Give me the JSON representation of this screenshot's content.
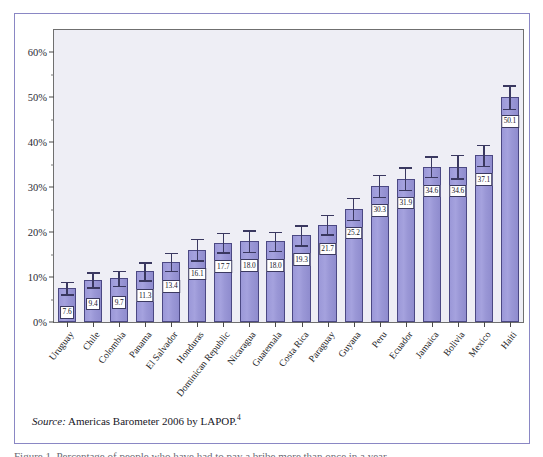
{
  "figure": {
    "source_prefix": "Source:",
    "source_text": " Americas Barometer 2006 by LAPOP.",
    "source_footnote": "4",
    "clipped_caption": "Figure 1. Percentage of people who have had to pay a bribe more than once in a year"
  },
  "chart_data": {
    "type": "bar",
    "title": "",
    "subtitle": "",
    "xlabel": "",
    "ylabel": "",
    "ylim": [
      0,
      65
    ],
    "grid": false,
    "legend": "none",
    "y_tick_labels": [
      "0%",
      "10%",
      "20%",
      "30%",
      "40%",
      "50%",
      "60%"
    ],
    "y_tick_values": [
      0,
      10,
      20,
      30,
      40,
      50,
      60
    ],
    "y_minor_tick_values": [
      5,
      15,
      25,
      35,
      45,
      55
    ],
    "bar_color": "#9b98d8",
    "bar_border_color": "#4b4883",
    "error_bar_color": "#3a3860",
    "plot_background": "#eeeef5",
    "frame_color": "#8a87c4",
    "categories": [
      "Uruguay",
      "Chile",
      "Colombia",
      "Panama",
      "El Salvador",
      "Honduras",
      "Dominican Republic",
      "Nicaragua",
      "Guatemala",
      "Costa Rica",
      "Paraguay",
      "Guyana",
      "Peru",
      "Ecuador",
      "Jamaica",
      "Bolivia",
      "Mexico",
      "Haiti"
    ],
    "values": [
      7.6,
      9.4,
      9.7,
      11.3,
      13.4,
      16.1,
      17.7,
      18.0,
      18.0,
      19.3,
      21.7,
      25.2,
      30.3,
      31.9,
      34.6,
      34.6,
      37.1,
      50.1
    ],
    "value_labels": [
      "7.6",
      "9.4",
      "9.7",
      "11.3",
      "13.4",
      "16.1",
      "17.7",
      "18.0",
      "18.0",
      "19.3",
      "21.7",
      "25.2",
      "30.3",
      "31.9",
      "34.6",
      "34.6",
      "37.1",
      "50.1"
    ],
    "error_upper": [
      9.0,
      11.1,
      11.4,
      13.3,
      15.4,
      18.5,
      19.9,
      20.4,
      20.1,
      21.5,
      23.9,
      27.6,
      32.7,
      34.4,
      36.9,
      37.2,
      39.4,
      52.7
    ],
    "error_lower": [
      6.2,
      7.7,
      8.0,
      9.3,
      11.4,
      13.7,
      15.5,
      15.6,
      15.9,
      17.1,
      19.5,
      22.8,
      27.9,
      29.4,
      32.3,
      32.0,
      34.8,
      47.5
    ]
  }
}
